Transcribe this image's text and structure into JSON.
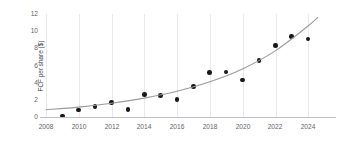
{
  "chart_data": {
    "type": "scatter",
    "title": "",
    "xlabel": "",
    "ylabel": "FCF per share ($)",
    "xlim": [
      2008,
      2024.6
    ],
    "ylim": [
      0,
      12
    ],
    "xticks": [
      "2008",
      "2010",
      "2012",
      "2014",
      "2016",
      "2018",
      "2020",
      "2022",
      "2024"
    ],
    "yticks": [
      "0",
      "2",
      "4",
      "6",
      "8",
      "10",
      "12"
    ],
    "grid": "vertical",
    "legend": "none",
    "marker_color": "#17171a",
    "trendline_color": "#9a9aa0",
    "grid_color": "#e9e9ec",
    "axis_color": "#bfbfc4",
    "x": [
      2009,
      2010,
      2011,
      2012,
      2013,
      2014,
      2015,
      2016,
      2017,
      2018,
      2019,
      2020,
      2021,
      2022,
      2023,
      2024
    ],
    "values": [
      0.1,
      0.8,
      1.2,
      1.7,
      0.9,
      2.6,
      2.5,
      2.05,
      3.55,
      5.2,
      5.25,
      4.3,
      6.55,
      8.3,
      9.35,
      9.1
    ],
    "series": [
      {
        "name": "FCF per share ($)",
        "values": [
          0.1,
          0.8,
          1.2,
          1.7,
          0.9,
          2.6,
          2.5,
          2.05,
          3.55,
          5.2,
          5.25,
          4.3,
          6.55,
          8.3,
          9.35,
          9.1
        ]
      },
      {
        "name": "trendline",
        "type": "exponential-fit",
        "x": [
          2008,
          2010,
          2012,
          2014,
          2016,
          2018,
          2020,
          2022,
          2024,
          2024.6
        ],
        "values": [
          0.85,
          1.15,
          1.6,
          2.2,
          3.0,
          4.1,
          5.6,
          7.7,
          10.6,
          11.6
        ]
      }
    ]
  }
}
